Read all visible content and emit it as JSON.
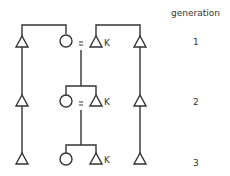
{
  "diagram": {
    "type": "kinship",
    "header": "generation",
    "generations": [
      {
        "label": "1",
        "members": [
          "male",
          "female",
          "male (K)",
          "male"
        ],
        "marriage": "female = male (K)"
      },
      {
        "label": "2",
        "members": [
          "male",
          "female",
          "male (K)",
          "male"
        ],
        "marriage": "female = male (K)"
      },
      {
        "label": "3",
        "members": [
          "male",
          "female",
          "male (K)",
          "male"
        ]
      }
    ],
    "marriage_symbol": "=",
    "marker": "K",
    "colors": {
      "line": "#333333",
      "text": "#333333",
      "background": "#ffffff"
    }
  }
}
